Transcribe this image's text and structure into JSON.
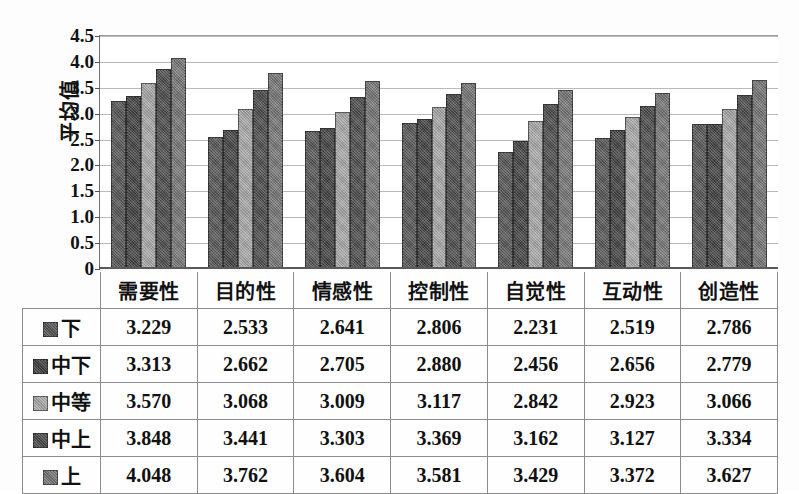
{
  "chart_data": {
    "type": "bar",
    "title": "",
    "xlabel": "",
    "ylabel": "平均值",
    "ylim": [
      0,
      4.5
    ],
    "ytick_labels": [
      "4.5",
      "4.0",
      "3.5",
      "3.0",
      "2.5",
      "2.0",
      "1.5",
      "1.0",
      "0.5",
      "0"
    ],
    "ytick_values": [
      4.5,
      4.0,
      3.5,
      3.0,
      2.5,
      2.0,
      1.5,
      1.0,
      0.5,
      0
    ],
    "grid": true,
    "legend_position": "table-left-column",
    "categories": [
      "需要性",
      "目的性",
      "情感性",
      "控制性",
      "自觉性",
      "互动性",
      "创造性"
    ],
    "series": [
      {
        "name": "下",
        "color": "#545454",
        "values": [
          3.229,
          2.533,
          2.641,
          2.806,
          2.231,
          2.519,
          2.786
        ]
      },
      {
        "name": "中下",
        "color": "#3f3f3f",
        "values": [
          3.313,
          2.662,
          2.705,
          2.88,
          2.456,
          2.656,
          2.779
        ]
      },
      {
        "name": "中等",
        "color": "#a8a8a8",
        "values": [
          3.57,
          3.068,
          3.009,
          3.117,
          2.842,
          2.923,
          3.066
        ]
      },
      {
        "name": "中上",
        "color": "#4a4a4a",
        "values": [
          3.848,
          3.441,
          3.303,
          3.369,
          3.162,
          3.127,
          3.334
        ]
      },
      {
        "name": "上",
        "color": "#757575",
        "values": [
          4.048,
          3.762,
          3.604,
          3.581,
          3.429,
          3.372,
          3.627
        ]
      }
    ]
  },
  "table": {
    "corner_label": "",
    "column_headers": [
      "需要性",
      "目的性",
      "情感性",
      "控制性",
      "自觉性",
      "互动性",
      "创造性"
    ],
    "rows": [
      {
        "label": "下",
        "values": [
          "3.229",
          "2.533",
          "2.641",
          "2.806",
          "2.231",
          "2.519",
          "2.786"
        ]
      },
      {
        "label": "中下",
        "values": [
          "3.313",
          "2.662",
          "2.705",
          "2.880",
          "2.456",
          "2.656",
          "2.779"
        ]
      },
      {
        "label": "中等",
        "values": [
          "3.570",
          "3.068",
          "3.009",
          "3.117",
          "2.842",
          "2.923",
          "3.066"
        ]
      },
      {
        "label": "中上",
        "values": [
          "3.848",
          "3.441",
          "3.303",
          "3.369",
          "3.162",
          "3.127",
          "3.334"
        ]
      },
      {
        "label": "上",
        "values": [
          "4.048",
          "3.762",
          "3.604",
          "3.581",
          "3.429",
          "3.372",
          "3.627"
        ]
      }
    ]
  }
}
